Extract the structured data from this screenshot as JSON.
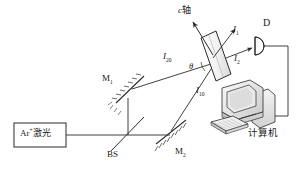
{
  "figure": {
    "type": "optical-setup-diagram",
    "width": 298,
    "height": 170,
    "background": "#ffffff",
    "line_color": "#2b2b2b"
  },
  "source": {
    "name": "argon-ion-laser",
    "label_prefix": "Ar",
    "label_sup": "+",
    "label_cjk": "激光",
    "box": {
      "x": 14,
      "y": 123,
      "w": 52,
      "h": 24
    }
  },
  "beamsplitter": {
    "name": "beam-splitter",
    "label": "BS"
  },
  "mirrors": [
    {
      "name": "mirror-m1",
      "label_main": "M",
      "label_sub": "1"
    },
    {
      "name": "mirror-m2",
      "label_main": "M",
      "label_sub": "2"
    }
  ],
  "crystal": {
    "name": "crystal-sample",
    "axis_label_it": "c",
    "axis_label_cjk": "轴",
    "angle_label": "θ"
  },
  "beams": [
    {
      "name": "incident-beam-i20",
      "label_main": "I",
      "label_sub": "20"
    },
    {
      "name": "incident-beam-i10",
      "label_main": "I",
      "label_sub": "10"
    },
    {
      "name": "output-beam-i1",
      "label_main": "I",
      "label_sub": "1"
    },
    {
      "name": "output-beam-i2",
      "label_main": "I",
      "label_sub": "2"
    }
  ],
  "detector": {
    "name": "photodetector",
    "label": "D"
  },
  "computer": {
    "name": "computer-workstation",
    "label_cjk": "计算机"
  }
}
